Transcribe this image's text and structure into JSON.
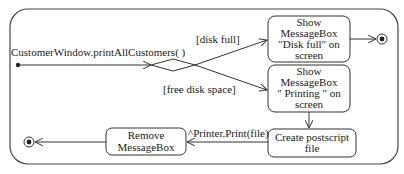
{
  "diagram": {
    "type": "UML activity/state diagram",
    "trigger_label": "CustomerWindow.printAllCustomers( )",
    "guards": {
      "disk_full": "[disk full]",
      "free_disk_space": "[free disk space]"
    },
    "states": [
      {
        "id": "show-disk-full",
        "lines": [
          "Show",
          "MessageBox",
          "\"Disk full\" on",
          "screen"
        ]
      },
      {
        "id": "show-printing",
        "lines": [
          "Show",
          "MessageBox",
          "\" Printing \" on",
          "screen"
        ]
      },
      {
        "id": "create-postscript",
        "lines": [
          "Create postscript",
          "file"
        ]
      },
      {
        "id": "remove-messagebox",
        "lines": [
          "Remove",
          "MessageBox"
        ]
      }
    ],
    "transition_labels": {
      "print_event": "^Printer.Print(file)"
    },
    "colors": {
      "stroke": "#333333",
      "text": "#1a1a1a",
      "background": "#ffffff"
    }
  }
}
